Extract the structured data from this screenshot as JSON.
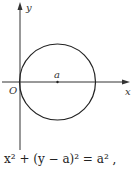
{
  "diagram": {
    "axes": {
      "x_label": "x",
      "y_label": "y",
      "origin_label": "O"
    },
    "circle": {
      "center_label": "a",
      "description": "circle tangent to y-axis at origin, centered on x-axis"
    },
    "equation": "x² + (y − a)² = a² ,"
  }
}
